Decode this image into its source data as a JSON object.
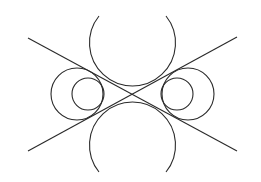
{
  "diagram": {
    "stroke_color": "#2a2a2a",
    "background": "#ffffff",
    "lines": [
      {
        "name": "line-descending",
        "x1": 28,
        "y1": 38,
        "x2": 237,
        "y2": 151
      },
      {
        "name": "line-ascending",
        "x1": 28,
        "y1": 151,
        "x2": 237,
        "y2": 37
      }
    ],
    "arcs": [
      {
        "name": "top-arc",
        "cx": 132,
        "cy": 46,
        "r": 43,
        "start": [
          99,
          16
        ],
        "end": [
          166,
          16
        ]
      },
      {
        "name": "bottom-arc",
        "cx": 132,
        "cy": 143,
        "r": 43,
        "start": [
          99,
          172
        ],
        "end": [
          166,
          172
        ]
      }
    ],
    "circles": [
      {
        "name": "left-large-circle",
        "cx": 77,
        "cy": 94,
        "r": 26
      },
      {
        "name": "left-small-circle",
        "cx": 88,
        "cy": 94,
        "r": 16
      },
      {
        "name": "right-large-circle",
        "cx": 188,
        "cy": 94,
        "r": 26
      },
      {
        "name": "right-small-circle",
        "cx": 177,
        "cy": 94,
        "r": 16
      }
    ]
  }
}
